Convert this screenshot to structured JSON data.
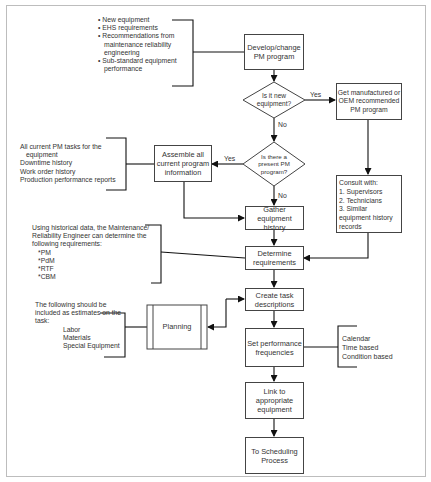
{
  "diagram": {
    "type": "flowchart",
    "nodes": {
      "develop": "Develop/change PM program",
      "is_new": "Is it new equipment?",
      "get_oem": "Get manufactured or OEM recommended PM program",
      "present_pm": "Is there a present PM program?",
      "assemble": "Assemble all current program information",
      "gather": "Gather equipment history",
      "consult": {
        "title": "Consult with:",
        "items": [
          "1. Supervisors",
          "2. Technicians",
          "3. Similar equipment history records"
        ]
      },
      "determine": "Determine requirements",
      "create": "Create task descriptions",
      "planning": "Planning",
      "set_freq": "Set performance frequencies",
      "link": "Link to appropriate equipment",
      "scheduling": "To Scheduling Process"
    },
    "edge_labels": {
      "yes_1": "Yes",
      "no_1": "No",
      "yes_2": "Yes",
      "no_2": "No"
    },
    "notes": {
      "triggers": [
        "New equipment",
        "EHS requirements",
        "Recommendations from maintenance reliability engineering",
        "Sub-standard equipment performance"
      ],
      "current_info": [
        "All current PM tasks for the",
        "equipment",
        "Downtime history",
        "Work order history",
        "Production performance reports"
      ],
      "historical": {
        "intro": "Using historical data, the Maintenance/ Reliability Engineer can determine the following requirements:",
        "items": [
          "*PM",
          "*PdM",
          "*RTF",
          "*CBM"
        ]
      },
      "estimates": {
        "intro": "The following should be included as estimates on the task:",
        "items": [
          "Labor",
          "Materials",
          "Special Equipment"
        ]
      },
      "frequencies": [
        "Calendar",
        "Time based",
        "Condition based"
      ]
    },
    "bullet": "•"
  }
}
